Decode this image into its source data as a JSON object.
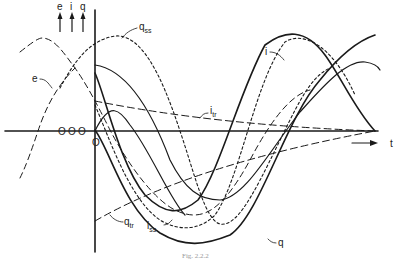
{
  "figure": {
    "caption": "Fig. 2.2.2",
    "axis_labels": {
      "vertical": [
        "e",
        "i",
        "q"
      ],
      "horizontal": "t",
      "origin": "O",
      "offsets": [
        "O",
        "O",
        "O"
      ]
    },
    "curve_labels": {
      "e": "e",
      "i": "i",
      "q_ss": {
        "main": "q",
        "sub": "ss"
      },
      "i_tr": {
        "main": "i",
        "sub": "tr"
      },
      "q_tr": {
        "main": "q",
        "sub": "tr"
      },
      "i_ss": {
        "main": "i",
        "sub": "ss"
      },
      "q": "q"
    },
    "colors": {
      "ink": "#1a1a1a",
      "background": "#ffffff"
    }
  }
}
